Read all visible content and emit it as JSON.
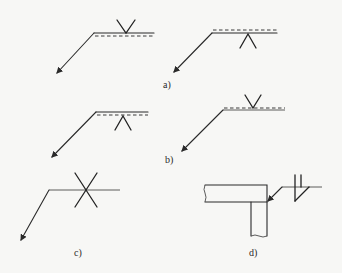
{
  "figure": {
    "panels": [
      {
        "id": "a",
        "label": "a)",
        "variants": [
          "V-groove above solid reference line with dashed line below",
          "Inverted V below solid line with dashed line above"
        ]
      },
      {
        "id": "b",
        "label": "b)",
        "variants": [
          "Inverted V below line with dashed line below",
          "V above dashed line with solid line below"
        ]
      },
      {
        "id": "c",
        "label": "c)",
        "variants": [
          "Double-V (X) symbol crossing reference line, no dashed line"
        ]
      },
      {
        "id": "d",
        "label": "d)",
        "variants": [
          "T-joint section with fillet/bevel weld symbol on reference line"
        ]
      }
    ]
  },
  "labels": {
    "a": "a)",
    "b": "b)",
    "c": "c)",
    "d": "d)"
  }
}
